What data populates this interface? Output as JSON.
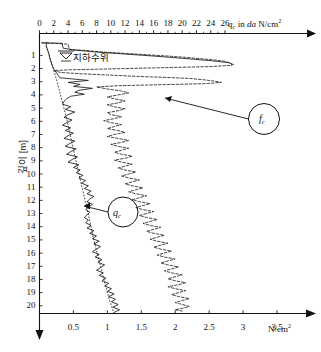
{
  "chart_data": {
    "type": "line",
    "title": "",
    "subtitle": "",
    "xlabel_top": "q_c in da N/cm2",
    "xlabel_bottom": "N/cm2",
    "ylabel": "깊이 [m]",
    "top_axis": {
      "label_prefix": "q",
      "label_sub": "c",
      "label_mid": " in ",
      "label_ital": "da",
      "label_unit": " N/cm",
      "label_sup": "2",
      "ticks": [
        0,
        2,
        4,
        6,
        8,
        10,
        12,
        14,
        16,
        18,
        20,
        22,
        24,
        26
      ],
      "range": [
        0,
        27.6
      ],
      "minor_ticks": [
        1,
        3,
        5,
        7,
        9,
        11,
        13,
        15,
        17,
        19,
        21,
        23,
        25
      ]
    },
    "bottom_axis": {
      "label_unit": "N/cm",
      "label_sup": "2",
      "ticks": [
        0.5,
        1,
        1.5,
        2,
        2.5,
        3,
        3.5
      ],
      "range": [
        0,
        4.1
      ]
    },
    "y_axis": {
      "label": "깊이 [m]",
      "ticks": [
        1,
        2,
        3,
        4,
        5,
        6,
        7,
        8,
        9,
        10,
        11,
        12,
        13,
        14,
        15,
        16,
        17,
        18,
        19,
        20
      ],
      "range": [
        0,
        20.8
      ]
    },
    "grid": false,
    "legend": "none",
    "annotations": [
      {
        "name": "groundwater-level",
        "text": "지하수위",
        "depth_m": 1.6
      },
      {
        "name": "qc-callout",
        "text": "q",
        "sub": "c",
        "depth_m": 13.3
      },
      {
        "name": "fc-callout",
        "text": "f",
        "sub": "c",
        "depth_m": 5.4
      }
    ],
    "series": [
      {
        "name": "qc",
        "label": "q_c",
        "style": "solid",
        "color": "#1a1a1a",
        "axis": "bottom",
        "unit": "N/cm2",
        "points": [
          [
            0.1,
            0.0
          ],
          [
            0.1,
            0.3
          ],
          [
            0.12,
            0.6
          ],
          [
            0.14,
            0.9
          ],
          [
            0.15,
            1.2
          ],
          [
            0.17,
            1.5
          ],
          [
            0.19,
            1.8
          ],
          [
            0.22,
            2.1
          ],
          [
            0.26,
            2.4
          ],
          [
            0.3,
            2.7
          ],
          [
            0.72,
            2.9
          ],
          [
            0.42,
            3.05
          ],
          [
            0.6,
            3.2
          ],
          [
            0.5,
            3.35
          ],
          [
            0.78,
            3.5
          ],
          [
            0.58,
            3.65
          ],
          [
            0.52,
            3.8
          ],
          [
            0.66,
            3.95
          ],
          [
            0.46,
            4.1
          ],
          [
            0.4,
            4.3
          ],
          [
            0.36,
            4.5
          ],
          [
            0.34,
            4.7
          ],
          [
            0.46,
            4.9
          ],
          [
            0.38,
            5.1
          ],
          [
            0.52,
            5.3
          ],
          [
            0.42,
            5.5
          ],
          [
            0.36,
            5.7
          ],
          [
            0.48,
            5.9
          ],
          [
            0.4,
            6.1
          ],
          [
            0.34,
            6.3
          ],
          [
            0.46,
            6.5
          ],
          [
            0.38,
            6.7
          ],
          [
            0.5,
            6.9
          ],
          [
            0.42,
            7.1
          ],
          [
            0.36,
            7.3
          ],
          [
            0.52,
            7.5
          ],
          [
            0.44,
            7.7
          ],
          [
            0.38,
            7.9
          ],
          [
            0.54,
            8.1
          ],
          [
            0.46,
            8.3
          ],
          [
            0.4,
            8.5
          ],
          [
            0.56,
            8.7
          ],
          [
            0.48,
            8.9
          ],
          [
            0.42,
            9.1
          ],
          [
            0.58,
            9.3
          ],
          [
            0.5,
            9.5
          ],
          [
            0.6,
            9.7
          ],
          [
            0.54,
            9.9
          ],
          [
            0.64,
            10.1
          ],
          [
            0.58,
            10.3
          ],
          [
            0.68,
            10.5
          ],
          [
            0.62,
            10.7
          ],
          [
            0.72,
            10.9
          ],
          [
            0.66,
            11.1
          ],
          [
            0.76,
            11.3
          ],
          [
            0.7,
            11.5
          ],
          [
            0.8,
            11.7
          ],
          [
            0.74,
            11.9
          ],
          [
            0.7,
            12.1
          ],
          [
            0.78,
            12.3
          ],
          [
            0.72,
            12.5
          ],
          [
            0.68,
            12.7
          ],
          [
            0.74,
            12.9
          ],
          [
            0.7,
            13.1
          ],
          [
            0.66,
            13.3
          ],
          [
            0.72,
            13.5
          ],
          [
            0.68,
            13.7
          ],
          [
            0.76,
            13.9
          ],
          [
            0.7,
            14.1
          ],
          [
            0.8,
            14.3
          ],
          [
            0.74,
            14.5
          ],
          [
            0.84,
            14.7
          ],
          [
            0.78,
            14.9
          ],
          [
            0.88,
            15.1
          ],
          [
            0.8,
            15.3
          ],
          [
            0.9,
            15.5
          ],
          [
            0.84,
            15.7
          ],
          [
            0.78,
            15.9
          ],
          [
            0.88,
            16.1
          ],
          [
            0.82,
            16.3
          ],
          [
            0.92,
            16.5
          ],
          [
            0.86,
            16.7
          ],
          [
            0.96,
            16.9
          ],
          [
            0.9,
            17.1
          ],
          [
            0.84,
            17.3
          ],
          [
            0.94,
            17.5
          ],
          [
            0.88,
            17.7
          ],
          [
            0.98,
            17.9
          ],
          [
            0.92,
            18.1
          ],
          [
            1.02,
            18.3
          ],
          [
            0.96,
            18.5
          ],
          [
            1.06,
            18.7
          ],
          [
            1.0,
            18.9
          ],
          [
            1.1,
            19.1
          ],
          [
            1.02,
            19.3
          ],
          [
            1.12,
            19.5
          ],
          [
            1.06,
            19.7
          ],
          [
            1.16,
            19.9
          ],
          [
            1.08,
            20.1
          ],
          [
            1.18,
            20.3
          ],
          [
            1.1,
            20.5
          ]
        ]
      },
      {
        "name": "qc-trend",
        "label": "q_c trend",
        "style": "dotted",
        "color": "#1a1a1a",
        "axis": "bottom",
        "unit": "N/cm2",
        "points": [
          [
            0.1,
            0.3
          ],
          [
            0.18,
            1.6
          ],
          [
            0.26,
            3.0
          ],
          [
            0.33,
            4.4
          ],
          [
            0.4,
            5.8
          ],
          [
            0.46,
            7.2
          ],
          [
            0.52,
            8.6
          ],
          [
            0.58,
            10.0
          ],
          [
            0.64,
            11.3
          ],
          [
            0.7,
            12.6
          ],
          [
            0.75,
            13.8
          ],
          [
            0.8,
            15.0
          ],
          [
            0.86,
            16.2
          ],
          [
            0.92,
            17.4
          ],
          [
            0.98,
            18.6
          ],
          [
            1.04,
            19.7
          ],
          [
            1.1,
            20.6
          ]
        ]
      },
      {
        "name": "fc",
        "label": "f_c",
        "style": "dashed",
        "color": "#1a1a1a",
        "axis": "top",
        "unit": "da N/cm2",
        "points": [
          [
            0.4,
            0.05
          ],
          [
            2.5,
            0.1
          ],
          [
            4.0,
            0.15
          ],
          [
            4.2,
            0.55
          ],
          [
            6.2,
            0.62
          ],
          [
            9.0,
            0.75
          ],
          [
            12.0,
            0.85
          ],
          [
            15.0,
            0.95
          ],
          [
            18.0,
            1.05
          ],
          [
            20.5,
            1.15
          ],
          [
            22.5,
            1.25
          ],
          [
            24.5,
            1.35
          ],
          [
            26.0,
            1.45
          ],
          [
            26.8,
            1.6
          ],
          [
            27.0,
            1.75
          ],
          [
            24.0,
            1.85
          ],
          [
            20.0,
            1.9
          ],
          [
            16.0,
            1.95
          ],
          [
            12.0,
            2.0
          ],
          [
            8.0,
            2.05
          ],
          [
            4.0,
            2.1
          ],
          [
            2.0,
            2.15
          ],
          [
            3.0,
            2.3
          ],
          [
            6.0,
            2.4
          ],
          [
            10.0,
            2.5
          ],
          [
            14.0,
            2.6
          ],
          [
            18.0,
            2.68
          ],
          [
            21.0,
            2.75
          ],
          [
            23.0,
            2.85
          ],
          [
            24.5,
            2.95
          ],
          [
            25.5,
            3.05
          ],
          [
            23.0,
            3.15
          ],
          [
            19.0,
            3.2
          ],
          [
            15.0,
            3.25
          ],
          [
            11.0,
            3.3
          ],
          [
            8.0,
            3.4
          ],
          [
            9.5,
            3.55
          ],
          [
            11.5,
            3.7
          ],
          [
            12.5,
            3.85
          ],
          [
            11.0,
            4.0
          ],
          [
            9.5,
            4.15
          ],
          [
            10.5,
            4.3
          ],
          [
            12.0,
            4.45
          ],
          [
            11.0,
            4.6
          ],
          [
            9.5,
            4.75
          ],
          [
            10.5,
            4.9
          ],
          [
            12.0,
            5.05
          ],
          [
            11.0,
            5.2
          ],
          [
            9.5,
            5.35
          ],
          [
            10.0,
            5.5
          ],
          [
            11.5,
            5.65
          ],
          [
            10.5,
            5.8
          ],
          [
            9.0,
            5.95
          ],
          [
            10.0,
            6.1
          ],
          [
            11.5,
            6.25
          ],
          [
            10.5,
            6.4
          ],
          [
            9.5,
            6.55
          ],
          [
            11.0,
            6.7
          ],
          [
            12.0,
            6.85
          ],
          [
            10.5,
            7.0
          ],
          [
            9.5,
            7.15
          ],
          [
            11.0,
            7.3
          ],
          [
            12.5,
            7.45
          ],
          [
            11.5,
            7.6
          ],
          [
            10.0,
            7.75
          ],
          [
            11.0,
            7.9
          ],
          [
            12.5,
            8.05
          ],
          [
            11.5,
            8.2
          ],
          [
            10.5,
            8.35
          ],
          [
            11.5,
            8.5
          ],
          [
            13.0,
            8.65
          ],
          [
            12.0,
            8.8
          ],
          [
            10.5,
            8.95
          ],
          [
            11.5,
            9.1
          ],
          [
            13.0,
            9.25
          ],
          [
            12.0,
            9.4
          ],
          [
            11.0,
            9.55
          ],
          [
            12.0,
            9.7
          ],
          [
            13.5,
            9.85
          ],
          [
            12.5,
            10.0
          ],
          [
            11.5,
            10.15
          ],
          [
            12.5,
            10.3
          ],
          [
            14.0,
            10.45
          ],
          [
            13.0,
            10.6
          ],
          [
            12.0,
            10.75
          ],
          [
            13.0,
            10.9
          ],
          [
            14.5,
            11.05
          ],
          [
            13.5,
            11.2
          ],
          [
            12.5,
            11.35
          ],
          [
            13.5,
            11.5
          ],
          [
            15.0,
            11.65
          ],
          [
            14.0,
            11.8
          ],
          [
            13.0,
            11.95
          ],
          [
            14.0,
            12.1
          ],
          [
            15.5,
            12.25
          ],
          [
            14.5,
            12.4
          ],
          [
            13.5,
            12.55
          ],
          [
            14.5,
            12.7
          ],
          [
            16.0,
            12.85
          ],
          [
            15.0,
            13.0
          ],
          [
            14.0,
            13.15
          ],
          [
            15.0,
            13.3
          ],
          [
            16.5,
            13.45
          ],
          [
            15.5,
            13.6
          ],
          [
            14.5,
            13.75
          ],
          [
            15.5,
            13.9
          ],
          [
            17.0,
            14.05
          ],
          [
            16.0,
            14.2
          ],
          [
            15.0,
            14.35
          ],
          [
            16.0,
            14.5
          ],
          [
            17.5,
            14.65
          ],
          [
            16.5,
            14.8
          ],
          [
            15.5,
            14.95
          ],
          [
            16.5,
            15.1
          ],
          [
            18.0,
            15.25
          ],
          [
            17.0,
            15.4
          ],
          [
            16.0,
            15.55
          ],
          [
            17.0,
            15.7
          ],
          [
            18.5,
            15.85
          ],
          [
            17.5,
            16.0
          ],
          [
            16.5,
            16.15
          ],
          [
            17.5,
            16.3
          ],
          [
            19.0,
            16.45
          ],
          [
            18.0,
            16.6
          ],
          [
            17.0,
            16.75
          ],
          [
            18.0,
            16.9
          ],
          [
            19.5,
            17.05
          ],
          [
            18.5,
            17.2
          ],
          [
            17.5,
            17.35
          ],
          [
            18.5,
            17.5
          ],
          [
            20.0,
            17.65
          ],
          [
            19.0,
            17.8
          ],
          [
            18.0,
            17.95
          ],
          [
            19.0,
            18.1
          ],
          [
            20.5,
            18.25
          ],
          [
            19.5,
            18.4
          ],
          [
            18.0,
            18.55
          ],
          [
            19.0,
            18.7
          ],
          [
            20.5,
            18.85
          ],
          [
            19.5,
            19.0
          ],
          [
            18.5,
            19.15
          ],
          [
            19.5,
            19.3
          ],
          [
            21.0,
            19.45
          ],
          [
            20.0,
            19.6
          ],
          [
            19.0,
            19.75
          ],
          [
            20.0,
            19.9
          ],
          [
            21.0,
            20.05
          ],
          [
            20.0,
            20.2
          ],
          [
            19.0,
            20.3
          ],
          [
            20.0,
            20.4
          ]
        ]
      },
      {
        "name": "soil-profile-top",
        "label": "surface layer",
        "style": "solid",
        "color": "#1a1a1a",
        "axis": "top",
        "unit": "da N/cm2",
        "points": [
          [
            0.3,
            0.05
          ],
          [
            3.2,
            0.08
          ],
          [
            3.3,
            0.45
          ],
          [
            5.0,
            0.6
          ],
          [
            8.0,
            0.75
          ],
          [
            12.0,
            0.9
          ],
          [
            16.0,
            1.05
          ],
          [
            20.0,
            1.22
          ],
          [
            24.0,
            1.4
          ],
          [
            26.5,
            1.55
          ],
          [
            27.2,
            1.7
          ]
        ]
      }
    ]
  },
  "callouts": {
    "qc": {
      "letter": "q",
      "sub": "c"
    },
    "fc": {
      "letter": "f",
      "sub": "c"
    }
  },
  "labels": {
    "groundwater": "지하수위",
    "depth_axis": "깊이 [m]",
    "top_axis_q": "q",
    "top_axis_q_sub": "c",
    "top_axis_in": " in ",
    "top_axis_da": "da",
    "top_axis_unit": " N/cm",
    "top_axis_sup": "2",
    "bottom_axis_unit": "N/cm",
    "bottom_axis_sup": "2"
  }
}
